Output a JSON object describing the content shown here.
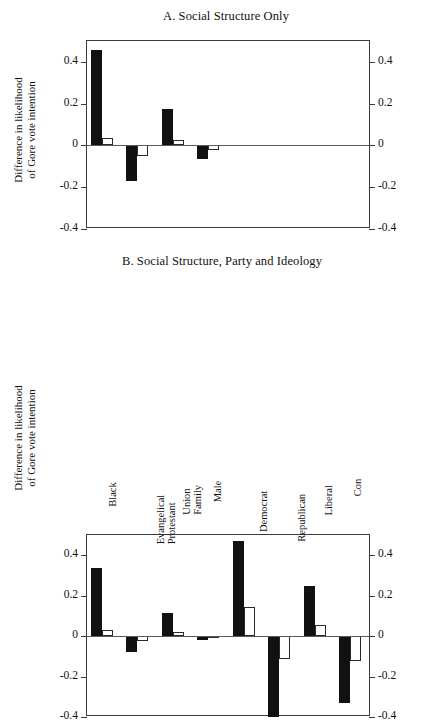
{
  "axis": {
    "y_title_line1": "Difference in likelihood",
    "y_title_line2": "of Gore vote intention",
    "ticks": [
      "0.4",
      "0.2",
      "0",
      "-0.2",
      "-0.4"
    ],
    "tick_values": [
      0.4,
      0.2,
      0,
      -0.2,
      -0.4
    ],
    "ylim": [
      -0.4,
      0.5
    ]
  },
  "panelA": {
    "title": "A. Social Structure Only"
  },
  "panelB": {
    "title": "B. Social Structure, Party and Ideology"
  },
  "chart_data": [
    {
      "type": "bar",
      "title": "A. Social Structure Only",
      "xlabel": "",
      "ylabel": "Difference in likelihood of Gore vote intention",
      "ylim": [
        -0.4,
        0.5
      ],
      "grid": false,
      "legend": "none",
      "categories": [
        "Black",
        "Evangelical Protestant",
        "Union Family",
        "Male"
      ],
      "category_lines": [
        [
          "Black"
        ],
        [
          "Evangelical",
          "Protestant"
        ],
        [
          "Union",
          "Family"
        ],
        [
          "Male"
        ]
      ],
      "series": [
        {
          "name": "solid",
          "style": "filled-black",
          "values": [
            0.455,
            -0.17,
            0.175,
            -0.065
          ]
        },
        {
          "name": "hollow",
          "style": "open-white",
          "values": [
            0.035,
            -0.05,
            0.025,
            -0.02
          ]
        }
      ]
    },
    {
      "type": "bar",
      "title": "B. Social Structure, Party and Ideology",
      "xlabel": "",
      "ylabel": "Difference in likelihood of Gore vote intention",
      "ylim": [
        -0.4,
        0.5
      ],
      "grid": false,
      "legend": "none",
      "categories": [
        "Black",
        "Evangelical Protestant",
        "Union Family",
        "Male",
        "Democrat",
        "Republican",
        "Liberal",
        "Con"
      ],
      "category_lines": [
        [
          "Black"
        ],
        [
          "Evangelical",
          "Protestant"
        ],
        [
          "Union",
          "Family"
        ],
        [
          "Male"
        ],
        [
          "Democrat"
        ],
        [
          "Republican"
        ],
        [
          "Liberal"
        ],
        [
          "Con"
        ]
      ],
      "series": [
        {
          "name": "solid",
          "style": "filled-black",
          "values": [
            0.335,
            -0.08,
            0.115,
            -0.02,
            0.47,
            -0.4,
            0.25,
            -0.33
          ]
        },
        {
          "name": "hollow",
          "style": "open-white",
          "values": [
            0.03,
            -0.025,
            0.02,
            -0.008,
            0.145,
            -0.115,
            0.055,
            -0.125
          ]
        }
      ]
    }
  ]
}
